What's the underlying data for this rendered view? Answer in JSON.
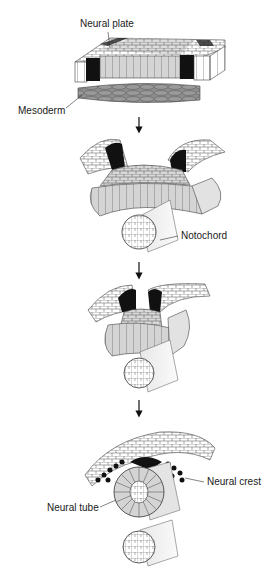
{
  "stages": [
    {
      "id": "stage-1",
      "description": "Flat neural plate above mesoderm"
    },
    {
      "id": "stage-2",
      "description": "Neural folds rise; notochord beneath"
    },
    {
      "id": "stage-3",
      "description": "Neural folds converge toward midline"
    },
    {
      "id": "stage-4",
      "description": "Neural tube closes; neural crest cells migrate"
    }
  ],
  "labels": {
    "neural_plate": "Neural plate",
    "mesoderm": "Mesoderm",
    "notochord": "Notochord",
    "neural_crest": "Neural crest",
    "neural_tube": "Neural tube"
  },
  "colors": {
    "neural_plate_fill": "#d4d4d4",
    "neural_fold_dark": "#111111",
    "mesoderm_fill": "#8a8a8a",
    "ectoderm_fill": "#ffffff",
    "outline": "#333333"
  }
}
